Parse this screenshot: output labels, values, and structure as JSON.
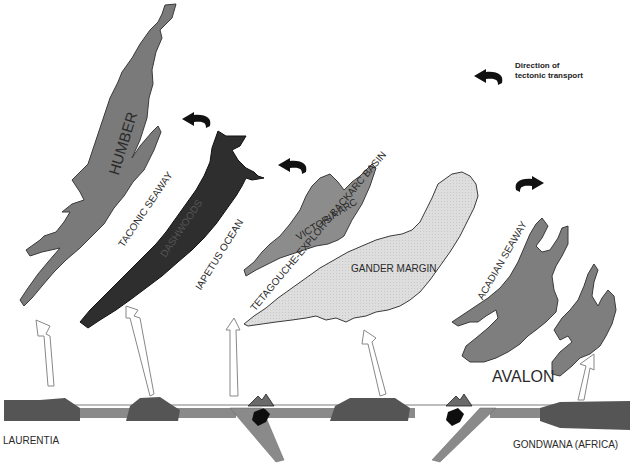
{
  "legend": {
    "line1": "Direction of",
    "line2": "tectonic transport",
    "icon": "curved-arrow-left-icon"
  },
  "terranes": {
    "humber": "HUMBER",
    "dashwoods": "DASHWOODS",
    "victoria_arc": "VICTORIA ARC",
    "gander_margin": "GANDER MARGIN",
    "avalon": "AVALON"
  },
  "seaways": {
    "taconic": "TACONIC SEAWAY",
    "iapetus": "IAPETUS OCEAN",
    "tetagouche": "TETAGOUCHE-EXPLOITS BACKARC BASIN",
    "acadian": "ACADIAN SEAWAY"
  },
  "continents": {
    "left": "LAURENTIA",
    "right": "GONDWANA (AFRICA)"
  },
  "colors": {
    "humber": "#7a7a7a",
    "dashwoods": "#2e2e2e",
    "victoria_arc": "#8c8c8c",
    "gander_margin": "#dcdcdc",
    "avalon": "#7e7e7e",
    "crust": "#555555",
    "lithosphere": "#8a8a8a"
  }
}
